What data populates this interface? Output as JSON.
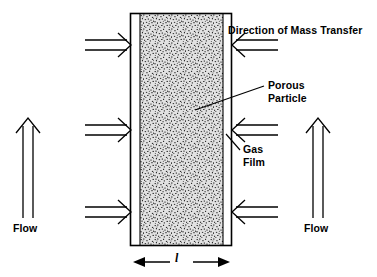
{
  "figure": {
    "type": "schematic-diagram",
    "width": 377,
    "height": 277,
    "background_color": "#ffffff",
    "line_color": "#000000"
  },
  "labels": {
    "mass_transfer": "Direction of Mass Transfer",
    "porous_particle": "Porous\nParticle",
    "gas_film": "Gas\nFilm",
    "flow_left": "Flow",
    "flow_right": "Flow",
    "thickness": "l"
  },
  "components": {
    "column": {
      "name": "porous particle slab",
      "left": 130,
      "right": 232,
      "top": 13,
      "bottom": 246,
      "wall_color": "#000000",
      "fill_pattern": "stipple",
      "fill_color": "#d9d9d9"
    },
    "gas_film": {
      "name": "gas film",
      "thickness_px": 7,
      "color": "#ffffff",
      "sides": [
        "left",
        "right"
      ]
    },
    "mass_transfer_arrows": {
      "count_per_side": 3,
      "rows_y": [
        45,
        130,
        212
      ],
      "left_direction": "right",
      "right_direction": "left",
      "style": "open-double-line"
    },
    "flow_arrows": {
      "count": 2,
      "direction": "up",
      "style": "open-double-line",
      "positions_x": [
        28,
        318
      ]
    },
    "dimension_arrow": {
      "name": "slab thickness dimension",
      "orientation": "horizontal",
      "double_headed": true,
      "y": 262,
      "from_x": 133,
      "to_x": 230
    }
  }
}
